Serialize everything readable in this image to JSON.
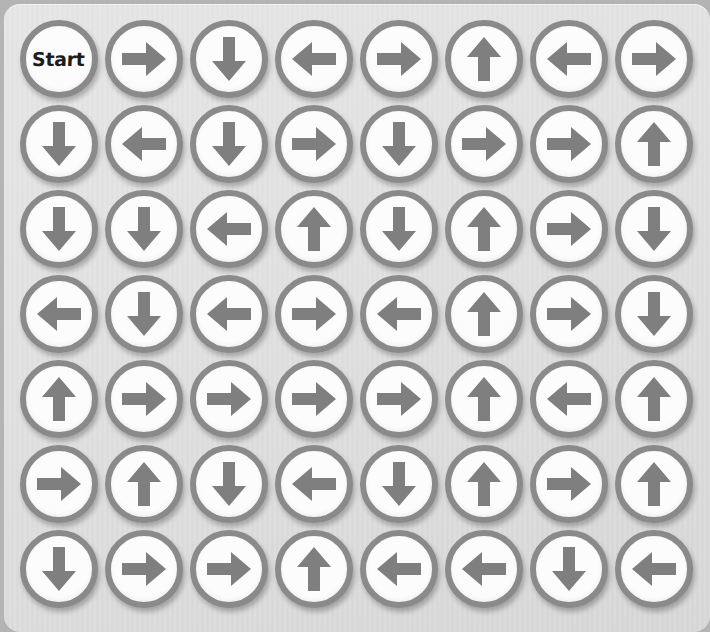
{
  "board": {
    "title": "Arrow Grid Puzzle",
    "rows": 7,
    "columns": 8,
    "start_label": "Start",
    "colors": {
      "backdrop": "#b4b4b4",
      "panel": "#e0e0e0",
      "disc_fill": "#fcfcfc",
      "disc_ring": "#8a8a8a",
      "arrow": "#7f7f7f",
      "start_text": "#1c1c1c"
    },
    "legend": {
      "up": "up-arrow",
      "down": "down-arrow",
      "left": "left-arrow",
      "right": "right-arrow",
      "start": "start-tile"
    },
    "cells": [
      [
        {
          "type": "start",
          "label": "Start"
        },
        {
          "type": "arrow",
          "dir": "right"
        },
        {
          "type": "arrow",
          "dir": "down"
        },
        {
          "type": "arrow",
          "dir": "left"
        },
        {
          "type": "arrow",
          "dir": "right"
        },
        {
          "type": "arrow",
          "dir": "up"
        },
        {
          "type": "arrow",
          "dir": "left"
        },
        {
          "type": "arrow",
          "dir": "right"
        }
      ],
      [
        {
          "type": "arrow",
          "dir": "down"
        },
        {
          "type": "arrow",
          "dir": "left"
        },
        {
          "type": "arrow",
          "dir": "down"
        },
        {
          "type": "arrow",
          "dir": "right"
        },
        {
          "type": "arrow",
          "dir": "down"
        },
        {
          "type": "arrow",
          "dir": "right"
        },
        {
          "type": "arrow",
          "dir": "right"
        },
        {
          "type": "arrow",
          "dir": "up"
        }
      ],
      [
        {
          "type": "arrow",
          "dir": "down"
        },
        {
          "type": "arrow",
          "dir": "down"
        },
        {
          "type": "arrow",
          "dir": "left"
        },
        {
          "type": "arrow",
          "dir": "up"
        },
        {
          "type": "arrow",
          "dir": "down"
        },
        {
          "type": "arrow",
          "dir": "up"
        },
        {
          "type": "arrow",
          "dir": "right"
        },
        {
          "type": "arrow",
          "dir": "down"
        }
      ],
      [
        {
          "type": "arrow",
          "dir": "left"
        },
        {
          "type": "arrow",
          "dir": "down"
        },
        {
          "type": "arrow",
          "dir": "left"
        },
        {
          "type": "arrow",
          "dir": "right"
        },
        {
          "type": "arrow",
          "dir": "left"
        },
        {
          "type": "arrow",
          "dir": "up"
        },
        {
          "type": "arrow",
          "dir": "right"
        },
        {
          "type": "arrow",
          "dir": "down"
        }
      ],
      [
        {
          "type": "arrow",
          "dir": "up"
        },
        {
          "type": "arrow",
          "dir": "right"
        },
        {
          "type": "arrow",
          "dir": "right"
        },
        {
          "type": "arrow",
          "dir": "right"
        },
        {
          "type": "arrow",
          "dir": "right"
        },
        {
          "type": "arrow",
          "dir": "up"
        },
        {
          "type": "arrow",
          "dir": "left"
        },
        {
          "type": "arrow",
          "dir": "up"
        }
      ],
      [
        {
          "type": "arrow",
          "dir": "right"
        },
        {
          "type": "arrow",
          "dir": "up"
        },
        {
          "type": "arrow",
          "dir": "down"
        },
        {
          "type": "arrow",
          "dir": "left"
        },
        {
          "type": "arrow",
          "dir": "down"
        },
        {
          "type": "arrow",
          "dir": "up"
        },
        {
          "type": "arrow",
          "dir": "right"
        },
        {
          "type": "arrow",
          "dir": "up"
        }
      ],
      [
        {
          "type": "arrow",
          "dir": "down"
        },
        {
          "type": "arrow",
          "dir": "right"
        },
        {
          "type": "arrow",
          "dir": "right"
        },
        {
          "type": "arrow",
          "dir": "up"
        },
        {
          "type": "arrow",
          "dir": "left"
        },
        {
          "type": "arrow",
          "dir": "left"
        },
        {
          "type": "arrow",
          "dir": "down"
        },
        {
          "type": "arrow",
          "dir": "left"
        }
      ]
    ]
  }
}
